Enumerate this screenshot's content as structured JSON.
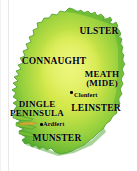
{
  "figure": {
    "width": 137,
    "height": 171,
    "background_color": "#ffffff"
  },
  "map": {
    "land_fill_center": "#d4e84a",
    "land_fill_edge": "#5eb335",
    "land_outline": "#3f8f27",
    "highlight_color": "#e0a93c",
    "sea_color": "#ffffff"
  },
  "provinces": [
    {
      "id": "ulster",
      "label": "ULSTER"
    },
    {
      "id": "connaught",
      "label": "CONNAUGHT"
    },
    {
      "id": "meath",
      "label_line1": "MEATH",
      "label_line2": "(MIDE)"
    },
    {
      "id": "leinster",
      "label": "LEINSTER"
    },
    {
      "id": "munster",
      "label": "MUNSTER"
    }
  ],
  "regions": [
    {
      "id": "dingle",
      "label_line1": "DINGLE",
      "label_line2": "PENINSULA"
    }
  ],
  "towns": [
    {
      "id": "clonfert",
      "label": "Clonfert"
    },
    {
      "id": "ardfert",
      "label": "Ardfert"
    }
  ]
}
